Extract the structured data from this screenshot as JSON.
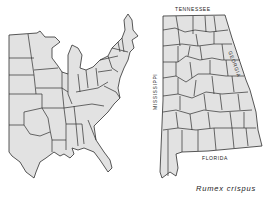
{
  "map": {
    "type": "species-distribution-map",
    "panels": [
      {
        "name": "eastern-united-states",
        "description": "State outlines of the eastern United States"
      },
      {
        "name": "alabama-counties",
        "description": "County outlines of Alabama"
      }
    ],
    "colors": {
      "land_fill": "#e2e2e2",
      "border": "#2e2e2e",
      "background": "#ffffff"
    }
  },
  "labels": {
    "north_border": "TENNESSEE",
    "east_border": "GEORGIA",
    "west_border": "MISSISSIPPI",
    "south_border": "FLORIDA"
  },
  "caption": "Rumex crispus"
}
